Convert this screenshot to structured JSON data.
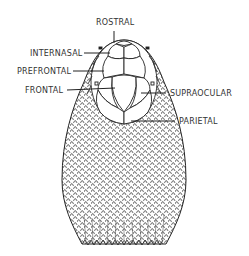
{
  "diagram": {
    "labels": {
      "rostral": "ROSTRAL",
      "internasal": "INTERNASAL",
      "prefrontal": "PREFRONTAL",
      "frontal": "FRONTAL",
      "supraocular": "SUPRAOCULAR",
      "parietal": "PARIETAL"
    },
    "colors": {
      "line": "#222222",
      "text": "#333333",
      "background": "#ffffff"
    }
  }
}
